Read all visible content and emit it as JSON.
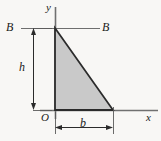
{
  "figure": {
    "type": "engineering-diagram",
    "background_color": "#f8f7f5",
    "shape": {
      "name": "right-triangle",
      "fill_color": "#c9c9c9",
      "stroke_color": "#2b2b2b",
      "vertices": [
        {
          "x": 55,
          "y": 28
        },
        {
          "x": 55,
          "y": 110
        },
        {
          "x": 113,
          "y": 110
        }
      ]
    },
    "axes": {
      "color": "#6e6e6e",
      "y_axis": {
        "label": "y",
        "x": 55,
        "y_top": 7,
        "y_bottom": 119
      },
      "x_axis": {
        "label": "x",
        "y": 110,
        "x_left": 40,
        "x_right": 158
      },
      "origin_label": "O"
    },
    "section_line": {
      "label_left": "B",
      "label_right": "B",
      "color": "#6e6e6e",
      "y": 28,
      "x_left": 21,
      "x_right": 100
    },
    "dimensions": [
      {
        "name": "height-dimension",
        "label": "h",
        "orientation": "vertical",
        "x": 33,
        "from_y": 28,
        "to_y": 110,
        "color": "#2b2b2b"
      },
      {
        "name": "base-dimension",
        "label": "b",
        "orientation": "horizontal",
        "y": 127,
        "from_x": 55,
        "to_x": 113,
        "color": "#2b2b2b"
      }
    ],
    "labels": {
      "y_axis": "y",
      "x_axis": "x",
      "origin": "O",
      "height": "h",
      "base": "b",
      "section_left": "B",
      "section_right": "B"
    }
  }
}
